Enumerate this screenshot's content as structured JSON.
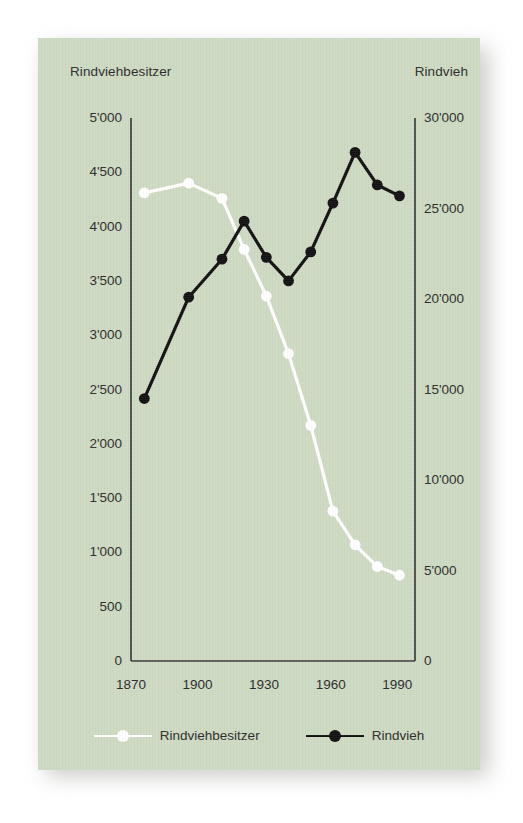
{
  "card": {
    "background_color": "#cddac2"
  },
  "captions": {
    "left": "Rindviehbesitzer",
    "right": "Rindvieh"
  },
  "legend": {
    "items": [
      {
        "label": "Rindviehbesitzer",
        "color": "#ffffff"
      },
      {
        "label": "Rindvieh",
        "color": "#111111"
      }
    ]
  },
  "chart_data": {
    "type": "line",
    "title": "",
    "xlabel": "",
    "grid": false,
    "legend_position": "bottom",
    "x": [
      1876,
      1896,
      1911,
      1921,
      1931,
      1941,
      1951,
      1961,
      1971,
      1981,
      1991
    ],
    "x_ticks": [
      "1870",
      "1900",
      "1930",
      "1960",
      "1990"
    ],
    "x_tick_values": [
      1870,
      1900,
      1930,
      1960,
      1990
    ],
    "xlim": [
      1870,
      1998
    ],
    "axes": [
      {
        "id": "left",
        "label": "Rindviehbesitzer",
        "ylim": [
          0,
          5000
        ],
        "ticks": [
          0,
          500,
          1000,
          1500,
          2000,
          2500,
          3000,
          3500,
          4000,
          4500,
          5000
        ],
        "tick_labels": [
          "0",
          "500",
          "1'000",
          "1'500",
          "2'000",
          "2'500",
          "3'000",
          "3'500",
          "4'000",
          "4'500",
          "5'000"
        ]
      },
      {
        "id": "right",
        "label": "Rindvieh",
        "ylim": [
          0,
          30000
        ],
        "ticks": [
          0,
          5000,
          10000,
          15000,
          20000,
          25000,
          30000
        ],
        "tick_labels": [
          "0",
          "5'000",
          "10'000",
          "15'000",
          "20'000",
          "25'000",
          "30'000"
        ]
      }
    ],
    "series": [
      {
        "name": "Rindviehbesitzer",
        "axis": "left",
        "color": "#ffffff",
        "marker": "circle",
        "values": [
          4310,
          4400,
          4260,
          3790,
          3360,
          2830,
          2170,
          1380,
          1070,
          870,
          790
        ]
      },
      {
        "name": "Rindvieh",
        "axis": "right",
        "color": "#111111",
        "marker": "circle",
        "values": [
          14500,
          20100,
          22200,
          24300,
          22300,
          21000,
          22600,
          25300,
          28100,
          26300,
          25700
        ]
      }
    ]
  }
}
